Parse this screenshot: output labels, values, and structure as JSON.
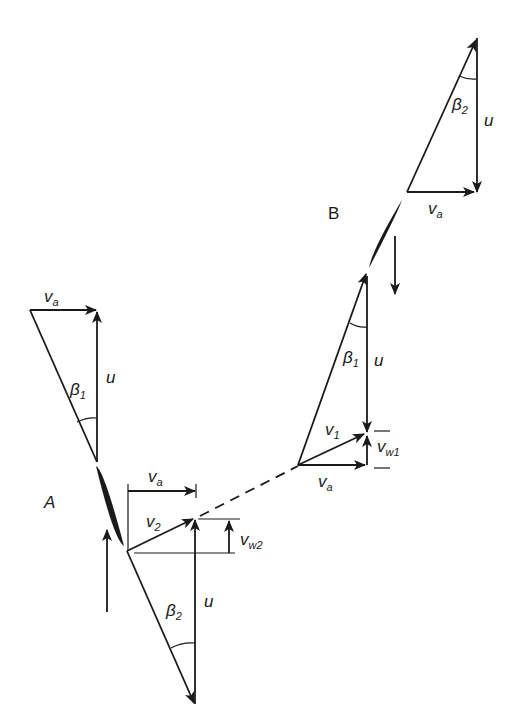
{
  "figure": {
    "stations": [
      {
        "id": "A",
        "label": "A"
      },
      {
        "id": "B",
        "label": "B"
      }
    ],
    "vector_labels": {
      "va": {
        "main": "v",
        "sub": "a"
      },
      "u": "u",
      "v1": {
        "main": "v",
        "sub": "1"
      },
      "v2": {
        "main": "v",
        "sub": "2"
      },
      "vw1": {
        "main": "v",
        "sub": "w1"
      },
      "vw2": {
        "main": "v",
        "sub": "w2"
      },
      "beta1": {
        "main": "β",
        "sub": "1"
      },
      "beta2": {
        "main": "β",
        "sub": "2"
      }
    },
    "colors": {
      "ink": "#1a1a1a",
      "background": "#ffffff"
    }
  }
}
